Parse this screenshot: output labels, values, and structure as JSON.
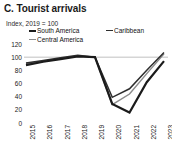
{
  "panel": {
    "label": "C.",
    "title": "C. Tourist arrivals",
    "subtitle": "Index, 2019 = 100"
  },
  "legend": {
    "position": "top",
    "items": [
      {
        "name": "South America",
        "color": "#1b1b1b",
        "swatch": "line-swatch"
      },
      {
        "name": "Caribbean",
        "color": "#2e2e2e",
        "swatch": "line-swatch"
      },
      {
        "name": "Central America",
        "color": "#8c8c8c",
        "swatch": "line-swatch"
      }
    ]
  },
  "axes": {
    "y_ticks": [
      "120",
      "100",
      "80",
      "60",
      "40",
      "20",
      "0"
    ],
    "x_ticks": [
      "2015",
      "2016",
      "2017",
      "2018",
      "2019",
      "2020",
      "2021",
      "2022",
      "2023"
    ]
  },
  "chart_data": {
    "type": "line",
    "title": "C. Tourist arrivals",
    "subtitle": "Index, 2019 = 100",
    "xlabel": "",
    "ylabel": "Index, 2019 = 100",
    "ylim": [
      0,
      120
    ],
    "grid": "reference-line-at-100",
    "legend_position": "top",
    "categories": [
      "2015",
      "2016",
      "2017",
      "2018",
      "2019",
      "2020",
      "2021",
      "2022",
      "2023"
    ],
    "series": [
      {
        "name": "South America",
        "color": "#1b1b1b",
        "width": 2.2,
        "values": [
          88,
          93,
          97,
          101,
          100,
          29,
          16,
          62,
          94
        ]
      },
      {
        "name": "Caribbean",
        "color": "#2e2e2e",
        "width": 1.5,
        "values": [
          91,
          95,
          99,
          103,
          100,
          39,
          52,
          80,
          107
        ]
      },
      {
        "name": "Central America",
        "color": "#8c8c8c",
        "width": 1.5,
        "values": [
          90,
          94,
          98,
          102,
          100,
          28,
          44,
          75,
          105
        ]
      }
    ],
    "reference_line": {
      "value": 100,
      "color": "#b0b0b0"
    },
    "annotations": []
  }
}
